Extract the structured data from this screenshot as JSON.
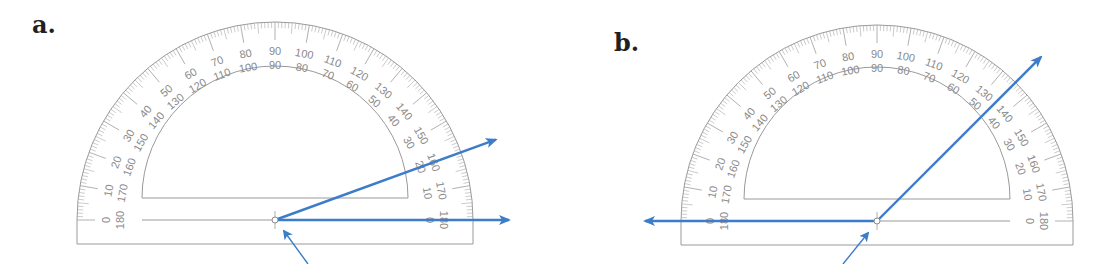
{
  "panels": [
    {
      "label": "a.",
      "center": [
        275,
        220
      ],
      "outer_radius": 198,
      "inner_radius": 133,
      "ray_angles_deg": [
        0,
        20
      ],
      "measured_angle_deg": 20,
      "pointer_arrow": {
        "from": [
          308,
          264
        ],
        "to": [
          284,
          231
        ]
      }
    },
    {
      "label": "b.",
      "center": [
        877,
        221
      ],
      "outer_radius": 196,
      "inner_radius": 133,
      "ray_angles_deg": [
        180,
        45
      ],
      "measured_angle_deg": 135,
      "pointer_arrow": {
        "from": [
          843,
          264
        ],
        "to": [
          868,
          233
        ]
      }
    }
  ],
  "scale": {
    "outer_labels": [
      "0",
      "10",
      "20",
      "30",
      "40",
      "50",
      "60",
      "70",
      "80",
      "90",
      "100",
      "110",
      "120",
      "130",
      "140",
      "150",
      "160",
      "170",
      "180"
    ],
    "inner_labels": [
      "180",
      "170",
      "160",
      "150",
      "140",
      "130",
      "120",
      "110",
      "100",
      "90",
      "80",
      "70",
      "60",
      "50",
      "40",
      "30",
      "20",
      "10",
      "0"
    ]
  },
  "colors": {
    "ray": "#3d7cc9",
    "protractor_line": "#9a9a9a",
    "tick": "#a8a8a8",
    "text": "#8a8a8a",
    "label": "#231f20"
  }
}
